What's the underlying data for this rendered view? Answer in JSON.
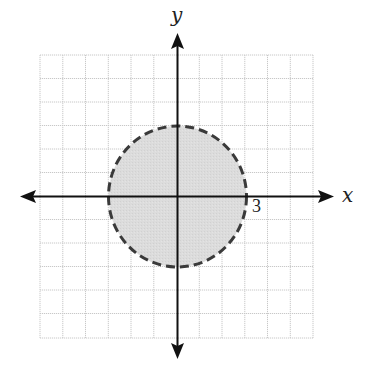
{
  "graph": {
    "x_axis_label": "x",
    "y_axis_label": "y",
    "tick_label": "3",
    "grid": {
      "xmin": -6,
      "xmax": 6,
      "ymin": -6,
      "ymax": 6,
      "step": 1
    },
    "circle": {
      "cx": 0,
      "cy": 0,
      "r": 3,
      "boundary": "dashed",
      "fill": "shaded"
    },
    "colors": {
      "grid": "#c8c8c8",
      "axis": "#111111",
      "circle_stroke": "#3a3a3a",
      "circle_fill": "#d9d9d9"
    }
  }
}
